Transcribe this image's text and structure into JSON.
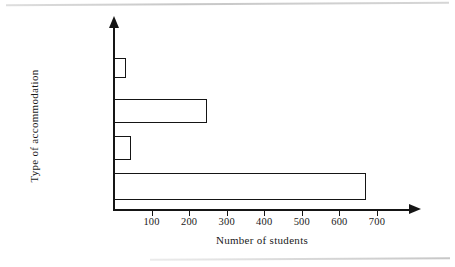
{
  "chart_data": {
    "type": "bar",
    "orientation": "horizontal",
    "title": "",
    "xlabel": "Number of students",
    "ylabel": "Type of accommodation",
    "categories": [
      "Hall of\nresidence",
      "Parental home",
      "Private rented",
      "Other"
    ],
    "values": [
      670,
      45,
      247,
      33
    ],
    "xlim": [
      0,
      790
    ],
    "xticks": [
      100,
      200,
      300,
      400,
      500,
      600,
      700
    ],
    "xtick_labels": [
      "100",
      "200",
      "300",
      "400",
      "500",
      "600",
      "700"
    ],
    "grid": false,
    "legend": null,
    "bar_fill": "#ffffff",
    "bar_edge": "#151515",
    "background": "#ffffff"
  },
  "figure": {
    "x_axis_title": "Number of students",
    "y_axis_title": "Type of accommodation"
  }
}
